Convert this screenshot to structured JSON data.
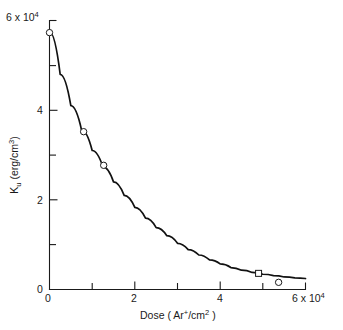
{
  "chart_data": {
    "type": "line",
    "title": "",
    "xlabel": "Dose ( Ar+/cm2 )",
    "ylabel": "Ku (erg/cm3)",
    "x_axis": {
      "min": 0,
      "max": 60000,
      "scale_note": "x 10^4",
      "major_ticks": [
        0,
        20000,
        40000,
        60000
      ],
      "major_tick_labels": [
        "0",
        "2",
        "4",
        "6 x 10⁴"
      ],
      "minor_ticks": [
        10000,
        30000,
        50000
      ],
      "grid": false
    },
    "y_axis": {
      "min": 0,
      "max": 60000,
      "scale_note": "x 10^4",
      "major_ticks": [
        0,
        20000,
        40000,
        60000
      ],
      "major_tick_labels": [
        "0",
        "2",
        "4",
        "6 x 10⁴"
      ],
      "minor_ticks": [
        10000,
        30000,
        50000
      ],
      "grid": false
    },
    "series": [
      {
        "name": "Ku vs Dose",
        "marker": "open-circle-and-square",
        "line": "solid-decay-curve",
        "points": [
          {
            "x": 0,
            "y": 57300,
            "marker": "circle"
          },
          {
            "x": 8000,
            "y": 35200,
            "marker": "circle"
          },
          {
            "x": 12700,
            "y": 27700,
            "marker": "circle"
          },
          {
            "x": 49000,
            "y": 3600,
            "marker": "square"
          },
          {
            "x": 53700,
            "y": 1600,
            "marker": "circle"
          }
        ],
        "curve_points": [
          {
            "x": 0,
            "y": 57500
          },
          {
            "x": 2500,
            "y": 48000
          },
          {
            "x": 5000,
            "y": 41000
          },
          {
            "x": 7500,
            "y": 35600
          },
          {
            "x": 10000,
            "y": 31000
          },
          {
            "x": 12500,
            "y": 27400
          },
          {
            "x": 15000,
            "y": 24000
          },
          {
            "x": 17500,
            "y": 21000
          },
          {
            "x": 20000,
            "y": 18300
          },
          {
            "x": 22500,
            "y": 15900
          },
          {
            "x": 25000,
            "y": 13800
          },
          {
            "x": 27500,
            "y": 12000
          },
          {
            "x": 30000,
            "y": 10300
          },
          {
            "x": 32500,
            "y": 8900
          },
          {
            "x": 35000,
            "y": 7700
          },
          {
            "x": 37500,
            "y": 6600
          },
          {
            "x": 40000,
            "y": 5700
          },
          {
            "x": 42500,
            "y": 4900
          },
          {
            "x": 45000,
            "y": 4300
          },
          {
            "x": 47500,
            "y": 3800
          },
          {
            "x": 50000,
            "y": 3400
          },
          {
            "x": 52500,
            "y": 3100
          },
          {
            "x": 55000,
            "y": 2800
          },
          {
            "x": 57500,
            "y": 2600
          },
          {
            "x": 60000,
            "y": 2450
          }
        ]
      }
    ],
    "legend": {
      "visible": false,
      "position": "none"
    },
    "annotations": []
  },
  "labels": {
    "y_top": {
      "mantissa": "6 x 10",
      "exponent": "4"
    },
    "y_4": "4",
    "y_2": "2",
    "y_0": "0",
    "x_0": "0",
    "x_2": "2",
    "x_4": "4",
    "x_top": {
      "mantissa": "6 x 10",
      "exponent": "4"
    },
    "ylabel": {
      "k": "K",
      "sub": "u",
      "rest": " (erg/cm",
      "sup": "3",
      "close": ")"
    },
    "xlabel": {
      "lead": "Dose ( Ar",
      "sup1": "+",
      "mid": "/cm",
      "sup2": "2",
      "close": " )"
    }
  }
}
